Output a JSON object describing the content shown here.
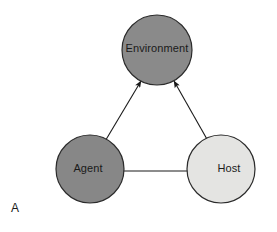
{
  "figure": {
    "panel_label": "A",
    "background_color": "#ffffff",
    "width": 277,
    "height": 232
  },
  "nodes": [
    {
      "id": "environment",
      "label": "Environment",
      "cx": 157,
      "cy": 50,
      "r": 35,
      "fill": "#8a8a8a",
      "stroke": "#2b2b2b",
      "label_dx": 0,
      "label_dy": -1
    },
    {
      "id": "agent",
      "label": "Agent",
      "cx": 90,
      "cy": 169,
      "r": 34,
      "fill": "#878787",
      "stroke": "#2b2b2b",
      "label_dx": -2,
      "label_dy": 0
    },
    {
      "id": "host",
      "label": "Host",
      "cx": 221,
      "cy": 169,
      "r": 34,
      "fill": "#e4e4e2",
      "stroke": "#2b2b2b",
      "label_dx": 8,
      "label_dy": 0
    }
  ],
  "edges": [
    {
      "id": "environment-agent",
      "from": "environment",
      "to": "agent",
      "arrow": "double",
      "x1": 141,
      "y1": 81,
      "x2": 101,
      "y2": 148
    },
    {
      "id": "environment-host",
      "from": "environment",
      "to": "host",
      "arrow": "double",
      "x1": 174,
      "y1": 81,
      "x2": 212,
      "y2": 148
    },
    {
      "id": "agent-host",
      "from": "agent",
      "to": "host",
      "arrow": "double",
      "x1": 116,
      "y1": 171,
      "x2": 196,
      "y2": 171
    }
  ],
  "colors": {
    "node_dark_gray": "#8a8a8a",
    "node_light_gray": "#e4e4e2",
    "outline": "#2b2b2b",
    "text": "#1a1a1a",
    "arrow": "#1a1a1a"
  }
}
